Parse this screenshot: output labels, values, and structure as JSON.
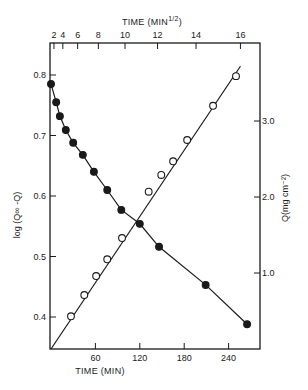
{
  "chart_data": {
    "type": "scatter",
    "title": "",
    "top_axis": {
      "label": "TIME (MIN",
      "label_sup": "1/2",
      "label_close": ")",
      "ticks": [
        2,
        4,
        6,
        8,
        10,
        12,
        14,
        16
      ]
    },
    "xlabel": "TIME (MIN)",
    "xticks": [
      60,
      120,
      180,
      240
    ],
    "xlim": [
      0,
      282
    ],
    "ylabel_left": "log (Q∞ -Q)",
    "yticks_left": [
      "0.4",
      "0.5",
      "0.6",
      "0.7",
      "0.8"
    ],
    "ylim_left": [
      0.347,
      0.84
    ],
    "ylabel_right": "Q(mg cm⁻²)",
    "yticks_right": [
      "1.0",
      "2.0",
      "3.0"
    ],
    "ylim_right": [
      0,
      3.92
    ],
    "grid": false,
    "legend": null,
    "series": [
      {
        "name": "log (Q∞ -Q) vs time",
        "marker": "filled-circle",
        "axis": "left",
        "x": [
          0,
          7,
          12,
          20,
          30,
          43,
          58,
          76,
          95,
          120,
          146,
          209,
          265
        ],
        "y": [
          0.785,
          0.755,
          0.732,
          0.709,
          0.688,
          0.668,
          0.64,
          0.61,
          0.577,
          0.554,
          0.516,
          0.453,
          0.388
        ]
      },
      {
        "name": "Q vs time",
        "marker": "open-circle",
        "axis": "right",
        "x": [
          27,
          45,
          61,
          76,
          96,
          132,
          149,
          165,
          184,
          219,
          250
        ],
        "y": [
          0.43,
          0.71,
          0.96,
          1.18,
          1.46,
          2.07,
          2.29,
          2.47,
          2.75,
          3.2,
          3.59
        ]
      }
    ]
  }
}
